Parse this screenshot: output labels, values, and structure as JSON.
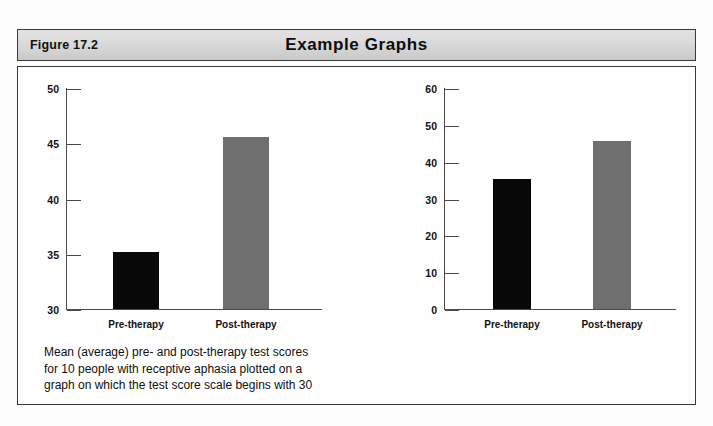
{
  "figure": {
    "label": "Figure 17.2",
    "title": "Example Graphs"
  },
  "colors": {
    "bar_pre": "#080808",
    "bar_post": "#6f6f6f",
    "axis": "#4a4a4a",
    "header_bg": "#d8d8d8",
    "border": "#3a3a3a"
  },
  "panels": [
    {
      "id": "left",
      "caption": "Mean (average) pre- and post-therapy test scores\nfor 10 people with receptive aphasia plotted on a\ngraph on which the test score scale begins with 30"
    },
    {
      "id": "right",
      "caption": "Mean (average) pre- and post-therapy test scores\nfor 10 people with receptive aphasia plotted on a\ngraph on which the test score scale begins with 0"
    }
  ],
  "chart_data": [
    {
      "type": "bar",
      "id": "left-chart",
      "title": "",
      "xlabel": "",
      "ylabel": "",
      "categories": [
        "Pre-therapy",
        "Post-therapy"
      ],
      "values": [
        35.2,
        45.6
      ],
      "ylim": [
        30,
        50
      ],
      "yticks": [
        30,
        35,
        40,
        45,
        50
      ],
      "ytick_labels": [
        "30",
        "35",
        "40",
        "45",
        "50"
      ],
      "bar_colors": [
        "#080808",
        "#6f6f6f"
      ],
      "grid": false,
      "legend": "none",
      "note": "Truncated y-axis starting at 30 exaggerates the difference"
    },
    {
      "type": "bar",
      "id": "right-chart",
      "title": "",
      "xlabel": "",
      "ylabel": "",
      "categories": [
        "Pre-therapy",
        "Post-therapy"
      ],
      "values": [
        35.2,
        45.6
      ],
      "ylim": [
        0,
        60
      ],
      "yticks": [
        0,
        10,
        20,
        30,
        40,
        50,
        60
      ],
      "ytick_labels": [
        "0",
        "10",
        "20",
        "30",
        "40",
        "50",
        "60"
      ],
      "bar_colors": [
        "#080808",
        "#6f6f6f"
      ],
      "grid": false,
      "legend": "none",
      "note": "Full y-axis starting at 0 shows the true proportional difference"
    }
  ]
}
